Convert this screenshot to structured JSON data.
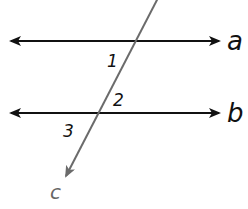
{
  "diagram": {
    "type": "parallel-lines-transversal",
    "lines": [
      {
        "id": "a",
        "label": "a",
        "color": "#111111"
      },
      {
        "id": "b",
        "label": "b",
        "color": "#111111"
      }
    ],
    "transversal": {
      "id": "c",
      "label": "c",
      "color": "#6b6b6b"
    },
    "angles": [
      {
        "id": "1",
        "label": "1"
      },
      {
        "id": "2",
        "label": "2"
      },
      {
        "id": "3",
        "label": "3"
      }
    ]
  }
}
